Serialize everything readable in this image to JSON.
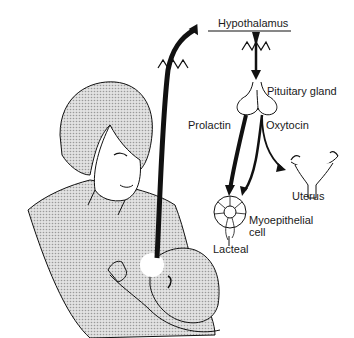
{
  "diagram": {
    "type": "physiology-illustration",
    "labels": {
      "hypothalamus": "Hypothalamus",
      "pituitary": "Pituitary gland",
      "prolactin": "Prolactin",
      "oxytocin": "Oxytocin",
      "uterus": "Uterus",
      "myoepithelial_1": "Myoepithelial",
      "myoepithelial_2": "cell",
      "lacteal": "Lacteal"
    },
    "nodes": [
      {
        "id": "breast",
        "label": "Nipple stimulation (suckling infant)"
      },
      {
        "id": "hypothalamus",
        "label": "Hypothalamus"
      },
      {
        "id": "pituitary",
        "label": "Pituitary gland"
      },
      {
        "id": "alveolus",
        "label": "Myoepithelial cell"
      },
      {
        "id": "lacteal",
        "label": "Lacteal"
      },
      {
        "id": "uterus",
        "label": "Uterus"
      }
    ],
    "edges": [
      {
        "from": "breast",
        "to": "hypothalamus",
        "label": "nerve signal"
      },
      {
        "from": "hypothalamus",
        "to": "pituitary",
        "label": ""
      },
      {
        "from": "pituitary",
        "to": "alveolus",
        "label": "Prolactin"
      },
      {
        "from": "pituitary",
        "to": "alveolus",
        "label": "Oxytocin"
      },
      {
        "from": "pituitary",
        "to": "uterus",
        "label": "Oxytocin"
      }
    ],
    "colors": {
      "ink": "#111111",
      "shading": "#c8c8c8",
      "background": "#ffffff"
    }
  }
}
